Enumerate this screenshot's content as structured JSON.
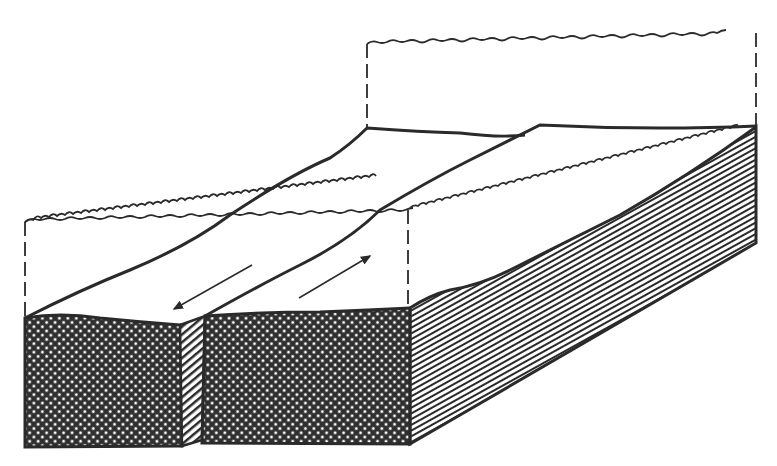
{
  "diagram": {
    "type": "geologic-block-diagram",
    "colors": {
      "background": "#ffffff",
      "line": "#2a2a2a",
      "fill_dark": "#2f2f2f",
      "fill_dot": "#ffffff"
    },
    "elements": [
      {
        "name": "eroded-upper-block-outline",
        "style": "wavy-dashed"
      },
      {
        "name": "upper-surface-left-block"
      },
      {
        "name": "upper-surface-right-block"
      },
      {
        "name": "fault-plane"
      },
      {
        "name": "front-face-left-block",
        "pattern": "crosshatch-dots"
      },
      {
        "name": "front-face-right-block",
        "pattern": "crosshatch-dots"
      },
      {
        "name": "side-face",
        "pattern": "horizontal-lines"
      },
      {
        "name": "fault-gap",
        "pattern": "diagonal-hatch"
      },
      {
        "name": "motion-arrow-left-block",
        "direction": "toward-viewer"
      },
      {
        "name": "motion-arrow-right-block",
        "direction": "away-from-viewer"
      }
    ]
  }
}
